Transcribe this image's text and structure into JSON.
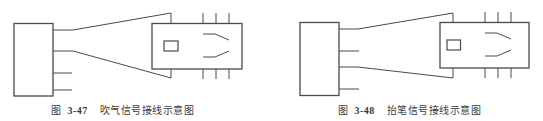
{
  "figures": [
    {
      "id": "fig-3-47",
      "caption_prefix": "图",
      "caption_number": "3-47",
      "caption_title": "吹气信号接线示意图",
      "description": "Blow (air) signal wiring: terminal block with 4 leads; top two leads fan out to relay",
      "lead_connections": [
        "to-relay-top",
        "to-relay-bottom",
        "open",
        "open"
      ]
    },
    {
      "id": "fig-3-48",
      "caption_prefix": "图",
      "caption_number": "3-48",
      "caption_title": "抬笔信号接线示意图",
      "description": "Pen-lift signal wiring: terminal block with 4 leads; first and third leads fan out to relay",
      "lead_connections": [
        "to-relay-top",
        "open",
        "to-relay-bottom",
        "open"
      ]
    }
  ],
  "colors": {
    "line": "#4a4a4a",
    "caption": "#3a3a3a",
    "background": "#ffffff"
  }
}
